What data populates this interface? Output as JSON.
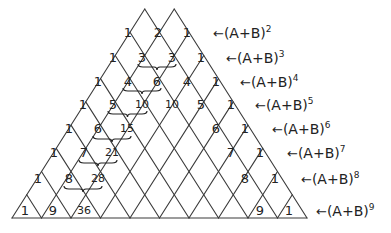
{
  "colors": {
    "line": "#3a3a3a",
    "text": "#222222",
    "background": "#ffffff"
  },
  "geometry": {
    "apexes_x": [
      128,
      158,
      187
    ],
    "top_y": 9,
    "base_y": 218,
    "base_left_x": 12,
    "base_right_x": 307
  },
  "rows": [
    {
      "power": "2",
      "y": 32,
      "label_x": 213,
      "entries": [
        {
          "v": "1",
          "x": 128
        },
        {
          "v": "2",
          "x": 158
        },
        {
          "v": "1",
          "x": 187
        }
      ]
    },
    {
      "power": "3",
      "y": 57,
      "label_x": 226,
      "entries": [
        {
          "v": "1",
          "x": 113
        },
        {
          "v": "3",
          "x": 142
        },
        {
          "v": "3",
          "x": 172
        },
        {
          "v": "1",
          "x": 201
        }
      ]
    },
    {
      "power": "4",
      "y": 81,
      "label_x": 240,
      "entries": [
        {
          "v": "1",
          "x": 98
        },
        {
          "v": "4",
          "x": 128
        },
        {
          "v": "6",
          "x": 157
        },
        {
          "v": "4",
          "x": 187
        },
        {
          "v": "1",
          "x": 216
        }
      ]
    },
    {
      "power": "5",
      "y": 104,
      "label_x": 255,
      "entries": [
        {
          "v": "1",
          "x": 83
        },
        {
          "v": "5",
          "x": 113
        },
        {
          "v": "10",
          "x": 142
        },
        {
          "v": "10",
          "x": 172
        },
        {
          "v": "5",
          "x": 201
        },
        {
          "v": "1",
          "x": 231
        }
      ]
    },
    {
      "power": "6",
      "y": 128,
      "label_x": 272,
      "entries": [
        {
          "v": "1",
          "x": 69
        },
        {
          "v": "6",
          "x": 98
        },
        {
          "v": "15",
          "x": 127
        },
        {
          "v": "6",
          "x": 216
        },
        {
          "v": "1",
          "x": 245
        }
      ]
    },
    {
      "power": "7",
      "y": 152,
      "label_x": 287,
      "entries": [
        {
          "v": "1",
          "x": 54
        },
        {
          "v": "7",
          "x": 84
        },
        {
          "v": "21",
          "x": 112
        },
        {
          "v": "7",
          "x": 231
        },
        {
          "v": "1",
          "x": 260
        }
      ]
    },
    {
      "power": "8",
      "y": 178,
      "label_x": 301,
      "entries": [
        {
          "v": "1",
          "x": 38
        },
        {
          "v": "8",
          "x": 69
        },
        {
          "v": "28",
          "x": 98
        },
        {
          "v": "8",
          "x": 245
        },
        {
          "v": "1",
          "x": 275
        }
      ]
    },
    {
      "power": "9",
      "y": 210,
      "label_x": 316,
      "entries": [
        {
          "v": "1",
          "x": 25
        },
        {
          "v": "9",
          "x": 53
        },
        {
          "v": "36",
          "x": 84
        },
        {
          "v": "9",
          "x": 260
        },
        {
          "v": "1",
          "x": 289
        }
      ]
    }
  ],
  "braces": [
    {
      "x1": 138,
      "x2": 176,
      "y": 67
    },
    {
      "x1": 123,
      "x2": 161,
      "y": 91
    },
    {
      "x1": 108,
      "x2": 147,
      "y": 114
    },
    {
      "x1": 93,
      "x2": 131,
      "y": 139
    },
    {
      "x1": 79,
      "x2": 117,
      "y": 163
    },
    {
      "x1": 64,
      "x2": 102,
      "y": 189
    }
  ],
  "label_text": {
    "arrow": "←",
    "base": "(A+B)"
  }
}
